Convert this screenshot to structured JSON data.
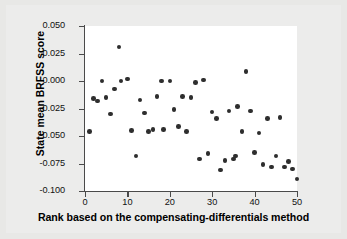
{
  "chart_data": {
    "type": "scatter",
    "title": "",
    "xlabel": "Rank based on the compensating-differentials method",
    "ylabel": "State mean BRFSS score",
    "xlim": [
      -1.5,
      52
    ],
    "ylim": [
      -0.1,
      0.05
    ],
    "grid": false,
    "legend": null,
    "xticks": [
      0,
      10,
      20,
      30,
      40,
      50
    ],
    "xtick_labels": [
      "0",
      "10",
      "20",
      "30",
      "40",
      "50"
    ],
    "yticks": [
      0.05,
      0.025,
      0.0,
      -0.025,
      -0.05,
      -0.075,
      -0.1
    ],
    "ytick_labels": [
      "0.050",
      "0.025",
      "0.000",
      "-0.025",
      "-0.050",
      "-0.075",
      "-0.100"
    ],
    "marker": "filled-circle",
    "marker_color": "#2e2e2e",
    "points": [
      {
        "x": 1,
        "y": -0.046
      },
      {
        "x": 2,
        "y": -0.016
      },
      {
        "x": 3,
        "y": -0.018
      },
      {
        "x": 4,
        "y": 0.0
      },
      {
        "x": 5,
        "y": -0.015
      },
      {
        "x": 6,
        "y": -0.03
      },
      {
        "x": 7,
        "y": -0.007
      },
      {
        "x": 8,
        "y": 0.031
      },
      {
        "x": 8.5,
        "y": 0.0
      },
      {
        "x": 10,
        "y": 0.002
      },
      {
        "x": 11,
        "y": -0.045
      },
      {
        "x": 12,
        "y": -0.068
      },
      {
        "x": 13,
        "y": -0.017
      },
      {
        "x": 14,
        "y": -0.029
      },
      {
        "x": 15,
        "y": -0.046
      },
      {
        "x": 16,
        "y": -0.044
      },
      {
        "x": 17,
        "y": -0.014
      },
      {
        "x": 18,
        "y": 0.0
      },
      {
        "x": 18.5,
        "y": -0.044
      },
      {
        "x": 20,
        "y": 0.0
      },
      {
        "x": 21,
        "y": -0.026
      },
      {
        "x": 22,
        "y": -0.041
      },
      {
        "x": 23,
        "y": -0.014
      },
      {
        "x": 24,
        "y": -0.046
      },
      {
        "x": 25,
        "y": -0.015
      },
      {
        "x": 26,
        "y": -0.001
      },
      {
        "x": 27,
        "y": -0.071
      },
      {
        "x": 28,
        "y": 0.001
      },
      {
        "x": 29,
        "y": -0.066
      },
      {
        "x": 30,
        "y": -0.028
      },
      {
        "x": 31,
        "y": -0.034
      },
      {
        "x": 32,
        "y": -0.081
      },
      {
        "x": 33,
        "y": -0.072
      },
      {
        "x": 34,
        "y": -0.027
      },
      {
        "x": 35,
        "y": -0.071
      },
      {
        "x": 35.5,
        "y": -0.068
      },
      {
        "x": 36,
        "y": -0.023
      },
      {
        "x": 37,
        "y": -0.046
      },
      {
        "x": 38,
        "y": 0.009
      },
      {
        "x": 39,
        "y": -0.027
      },
      {
        "x": 40,
        "y": -0.065
      },
      {
        "x": 41,
        "y": -0.047
      },
      {
        "x": 42,
        "y": -0.076
      },
      {
        "x": 43,
        "y": -0.034
      },
      {
        "x": 44,
        "y": -0.078
      },
      {
        "x": 45,
        "y": -0.068
      },
      {
        "x": 46,
        "y": -0.033
      },
      {
        "x": 47,
        "y": -0.078
      },
      {
        "x": 48,
        "y": -0.073
      },
      {
        "x": 49,
        "y": -0.08
      },
      {
        "x": 50,
        "y": -0.089
      }
    ]
  }
}
